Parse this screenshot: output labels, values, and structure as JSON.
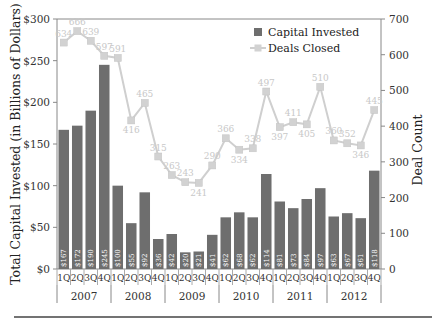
{
  "chart_data": {
    "type": "bar",
    "title": "",
    "categories": [
      "1Q",
      "2Q",
      "3Q",
      "4Q",
      "1Q",
      "2Q",
      "3Q",
      "4Q",
      "1Q",
      "2Q",
      "3Q",
      "4Q",
      "1Q",
      "2Q",
      "3Q",
      "4Q",
      "1Q",
      "2Q",
      "3Q",
      "4Q",
      "1Q",
      "2Q",
      "3Q",
      "4Q"
    ],
    "year_groups": [
      "2007",
      "2008",
      "2009",
      "2010",
      "2011",
      "2012"
    ],
    "ylabel": "Total Capital Invested (in Billions of Dollars)",
    "y2label": "Deal Count",
    "ylim": [
      0,
      300
    ],
    "y2lim": [
      0,
      700
    ],
    "yticks": [
      "$0",
      "$50",
      "$100",
      "$150",
      "$200",
      "$250",
      "$300"
    ],
    "y2ticks": [
      "0",
      "100",
      "200",
      "300",
      "400",
      "500",
      "600",
      "700"
    ],
    "grid": false,
    "legend_position": "top-right",
    "series": [
      {
        "name": "Capital Invested",
        "type": "bar",
        "axis": "left",
        "color": "#6e6e6e",
        "values": [
          167,
          172,
          190,
          245,
          100,
          55,
          92,
          36,
          42,
          20,
          21,
          41,
          62,
          68,
          62,
          114,
          81,
          73,
          84,
          97,
          63,
          67,
          61,
          118
        ],
        "labels": [
          "$167",
          "$172",
          "$190",
          "$245",
          "$100",
          "$55",
          "$92",
          "$36",
          "$42",
          "$20",
          "$21",
          "$41",
          "$62",
          "$68",
          "$62",
          "$114",
          "$81",
          "$73",
          "$84",
          "$97",
          "$63",
          "$67",
          "$61",
          "$118"
        ]
      },
      {
        "name": "Deals Closed",
        "type": "line",
        "axis": "right",
        "color": "#cfcfcf",
        "values": [
          634,
          666,
          639,
          597,
          591,
          416,
          465,
          315,
          263,
          243,
          241,
          290,
          366,
          334,
          338,
          497,
          397,
          411,
          405,
          510,
          360,
          352,
          346,
          445
        ]
      }
    ]
  }
}
